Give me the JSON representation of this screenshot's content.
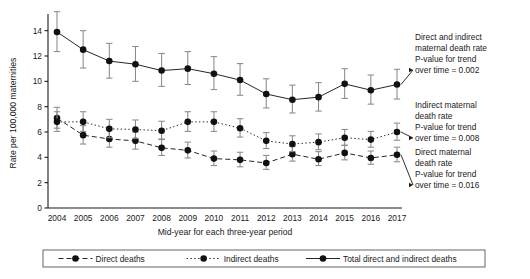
{
  "chart_data": {
    "type": "line",
    "title": "",
    "xlabel": "Mid-year for each three-year period",
    "ylabel": "Rate per 100,000 maternities",
    "categories": [
      "2004",
      "2005",
      "2006",
      "2007",
      "2008",
      "2009",
      "2010",
      "2011",
      "2012",
      "2013",
      "2014",
      "2015",
      "2016",
      "2017"
    ],
    "xlim": [
      2003.4,
      2017.6
    ],
    "ylim": [
      0,
      15
    ],
    "yticks": [
      0,
      2,
      4,
      6,
      8,
      10,
      12,
      14
    ],
    "grid": false,
    "legend_position": "bottom",
    "series": [
      {
        "name": "Direct deaths",
        "line_style": "dashed",
        "values": [
          7.1,
          5.75,
          5.45,
          5.3,
          4.75,
          4.55,
          3.9,
          3.8,
          3.55,
          4.25,
          3.85,
          4.35,
          3.95,
          4.2
        ],
        "ci_lower": [
          6.3,
          5.05,
          4.8,
          4.65,
          4.15,
          3.95,
          3.35,
          3.25,
          3.05,
          3.7,
          3.35,
          3.8,
          3.45,
          3.65
        ],
        "ci_upper": [
          7.95,
          6.5,
          6.15,
          6.0,
          5.4,
          5.2,
          4.5,
          4.4,
          4.15,
          4.85,
          4.45,
          4.95,
          4.5,
          4.8
        ]
      },
      {
        "name": "Indirect deaths",
        "line_style": "dotted",
        "values": [
          6.8,
          6.8,
          6.25,
          6.2,
          6.1,
          6.8,
          6.8,
          6.3,
          5.3,
          5.05,
          5.2,
          5.55,
          5.4,
          6.0
        ],
        "ci_lower": [
          6.05,
          6.05,
          5.55,
          5.5,
          5.45,
          6.05,
          6.05,
          5.6,
          4.7,
          4.45,
          4.6,
          4.95,
          4.8,
          5.35
        ],
        "ci_upper": [
          7.6,
          7.6,
          7.0,
          6.95,
          6.85,
          7.6,
          7.6,
          7.05,
          5.95,
          5.7,
          5.85,
          6.2,
          6.05,
          6.7
        ]
      },
      {
        "name": "Total direct and indirect deaths",
        "line_style": "solid",
        "values": [
          13.9,
          12.5,
          11.6,
          11.35,
          10.85,
          11.0,
          10.6,
          10.1,
          9.0,
          8.55,
          8.75,
          9.8,
          9.3,
          9.75
        ],
        "ci_lower": [
          12.35,
          11.05,
          10.25,
          10.0,
          9.6,
          9.75,
          9.35,
          8.9,
          7.9,
          7.5,
          7.65,
          8.65,
          8.2,
          8.6
        ],
        "ci_upper": [
          15.5,
          14.0,
          13.0,
          12.75,
          12.2,
          12.35,
          11.95,
          11.4,
          10.2,
          9.7,
          9.9,
          11.0,
          10.5,
          10.95
        ]
      }
    ],
    "annotations": [
      {
        "id": "total-annotation",
        "lines": [
          "Direct and indirect",
          "maternal death rate",
          "P-value for trend",
          "over time = 0.002"
        ],
        "target_series": "Total direct and indirect deaths",
        "target_year": "2017"
      },
      {
        "id": "indirect-annotation",
        "lines": [
          "Indirect maternal",
          "death rate",
          "P-value for trend",
          "over time = 0.008"
        ],
        "target_series": "Indirect deaths",
        "target_year": "2017"
      },
      {
        "id": "direct-annotation",
        "lines": [
          "Direct maternal",
          "death rate",
          "P-value for trend",
          "over time = 0.016"
        ],
        "target_series": "Direct deaths",
        "target_year": "2017"
      }
    ],
    "legend": [
      {
        "label": "Direct deaths",
        "style": "dashed"
      },
      {
        "label": "Indirect deaths",
        "style": "dotted"
      },
      {
        "label": "Total direct and indirect deaths",
        "style": "solid"
      }
    ]
  }
}
